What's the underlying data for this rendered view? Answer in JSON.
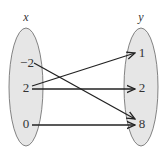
{
  "diagram": {
    "type": "mapping",
    "domain_set": {
      "label": "x",
      "elements": [
        {
          "id": "d0",
          "text": "−2",
          "y": 63
        },
        {
          "id": "d1",
          "text": "2",
          "y": 88
        },
        {
          "id": "d2",
          "text": "0",
          "y": 124
        }
      ]
    },
    "range_set": {
      "label": "y",
      "elements": [
        {
          "id": "r0",
          "text": "1",
          "y": 53
        },
        {
          "id": "r1",
          "text": "2",
          "y": 88
        },
        {
          "id": "r2",
          "text": "8",
          "y": 124
        }
      ]
    },
    "mappings": [
      {
        "from": "−2",
        "to": "8"
      },
      {
        "from": "2",
        "to": "1"
      },
      {
        "from": "2",
        "to": "2"
      },
      {
        "from": "0",
        "to": "8"
      }
    ],
    "colors": {
      "ellipse_fill": "#e6e6e6",
      "ellipse_stroke": "#666666",
      "arrow": "#222222",
      "text": "#333333"
    }
  }
}
